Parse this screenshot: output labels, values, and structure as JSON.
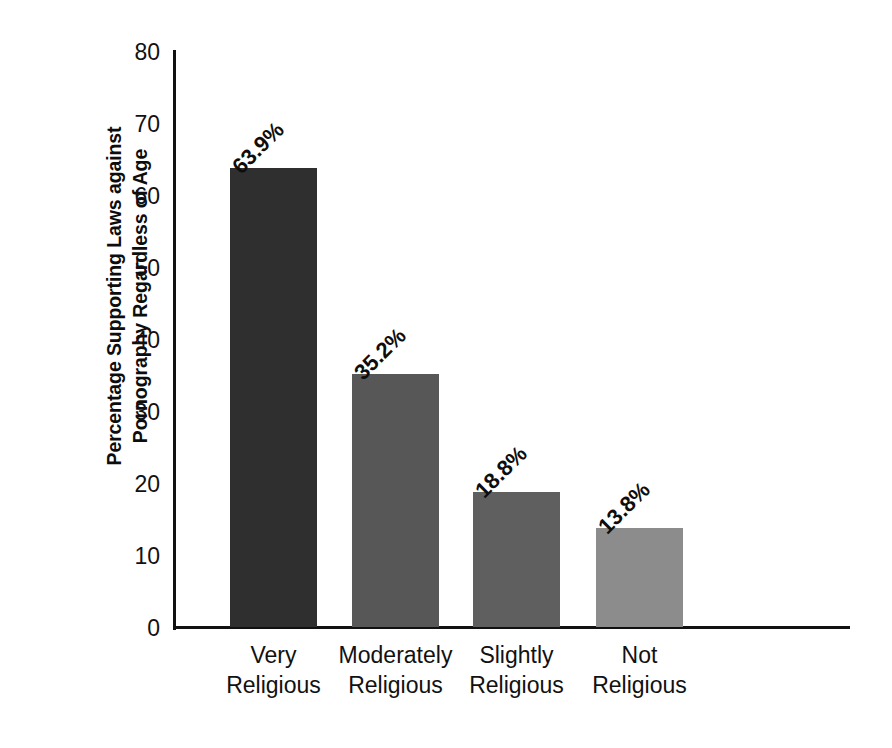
{
  "chart_data": {
    "type": "bar",
    "title": "",
    "xlabel": "",
    "ylabel": "Percentage Supporting Laws against Pornography Regardless of Age",
    "ylabel_lines": [
      "Percentage Supporting Laws against",
      "Pornography Regardless of Age"
    ],
    "categories": [
      "Very Religious",
      "Moderately Religious",
      "Slightly Religious",
      "Not Religious"
    ],
    "category_lines": [
      [
        "Very",
        "Religious"
      ],
      [
        "Moderately",
        "Religious"
      ],
      [
        "Slightly",
        "Religious"
      ],
      [
        "Not",
        "Religious"
      ]
    ],
    "values": [
      63.9,
      35.2,
      18.8,
      13.8
    ],
    "value_labels": [
      "63.9%",
      "35.2%",
      "18.8%",
      "13.8%"
    ],
    "bar_colors": [
      "#2f2f2f",
      "#575757",
      "#5f5f5f",
      "#8c8c8c"
    ],
    "ylim": [
      0,
      80
    ],
    "yticks": [
      0,
      10,
      20,
      30,
      40,
      50,
      60,
      70,
      80
    ],
    "ytick_labels": [
      "0",
      "10",
      "20",
      "30",
      "40",
      "50",
      "60",
      "70",
      "80"
    ],
    "grid": false,
    "legend": "none",
    "background_color": "#ffffff",
    "axis_color": "#111111"
  }
}
